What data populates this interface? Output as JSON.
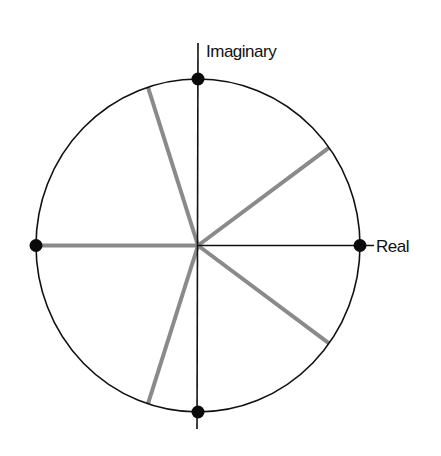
{
  "diagram": {
    "title": "",
    "axes": {
      "real_label": "Real",
      "imaginary_label": "Imaginary"
    },
    "unit_circle": {
      "radius": 1
    },
    "axis_points": [
      {
        "name": "positive-real",
        "re": 1,
        "im": 0
      },
      {
        "name": "positive-imaginary",
        "re": 0,
        "im": 1
      },
      {
        "name": "negative-real",
        "re": -1,
        "im": 0
      },
      {
        "name": "negative-imaginary",
        "re": 0,
        "im": -1
      }
    ],
    "spokes": [
      {
        "angle_deg": 36
      },
      {
        "angle_deg": 108
      },
      {
        "angle_deg": 180
      },
      {
        "angle_deg": -108
      },
      {
        "angle_deg": -36
      }
    ],
    "colors": {
      "axis": "#111111",
      "circle": "#111111",
      "spoke": "#8a8a8a",
      "point": "#0a0a0a"
    }
  }
}
